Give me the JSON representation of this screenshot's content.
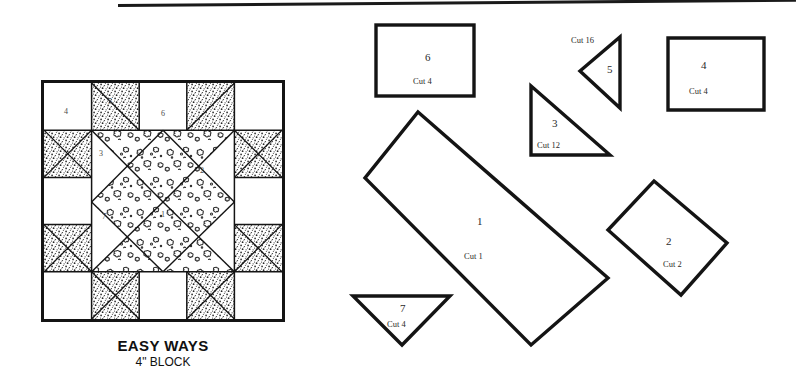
{
  "page": {
    "title_main": "EASY WAYS",
    "title_sub": "4\" BLOCK",
    "ink_color": "#141414",
    "paper_color": "#ffffff"
  },
  "block_diagram": {
    "name": "easy-ways-quilt-block",
    "grid": "5x5",
    "piece_labels": [
      {
        "id": "4",
        "text": "4",
        "x": 20,
        "y": 24
      },
      {
        "id": "5",
        "text": "5",
        "x": 64,
        "y": 14
      },
      {
        "id": "6",
        "text": "6",
        "x": 117,
        "y": 26
      },
      {
        "id": "3",
        "text": "3",
        "x": 55,
        "y": 66
      },
      {
        "id": "2",
        "text": "2",
        "x": 156,
        "y": 83
      },
      {
        "id": "7",
        "text": "7",
        "x": 58,
        "y": 129
      },
      {
        "id": "1",
        "text": "1",
        "x": 117,
        "y": 127
      }
    ]
  },
  "pattern_pieces": [
    {
      "id": "6",
      "shape": "rectangle",
      "number": "6",
      "cut": "Cut 4",
      "num_x": 425,
      "num_y": 51,
      "cut_x": 413,
      "cut_y": 76
    },
    {
      "id": "5",
      "shape": "triangle-left",
      "number": "5",
      "cut": "Cut 16",
      "num_x": 607,
      "num_y": 68,
      "cut_x": 573,
      "cut_y": 41
    },
    {
      "id": "4",
      "shape": "square",
      "number": "4",
      "cut": "Cut 4",
      "num_x": 700,
      "num_y": 65,
      "cut_x": 689,
      "cut_y": 92
    },
    {
      "id": "3",
      "shape": "right-triangle",
      "number": "3",
      "cut": "Cut 12",
      "num_x": 553,
      "num_y": 124,
      "cut_x": 538,
      "cut_y": 146
    },
    {
      "id": "1",
      "shape": "rotated-rectangle",
      "number": "1",
      "cut": "Cut 1",
      "num_x": 478,
      "num_y": 221,
      "cut_x": 466,
      "cut_y": 257
    },
    {
      "id": "2",
      "shape": "diamond",
      "number": "2",
      "cut": "Cut 2",
      "num_x": 667,
      "num_y": 241,
      "cut_x": 665,
      "cut_y": 265
    },
    {
      "id": "7",
      "shape": "triangle-down",
      "number": "7",
      "cut": "Cut 4",
      "num_x": 401,
      "num_y": 309,
      "cut_x": 388,
      "cut_y": 325
    }
  ]
}
